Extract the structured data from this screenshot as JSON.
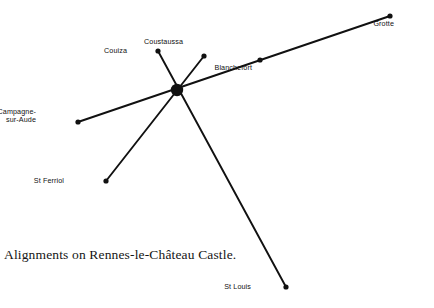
{
  "canvas": {
    "width": 434,
    "height": 308,
    "background": "#ffffff"
  },
  "caption": {
    "text": "Alignments on Rennes-le-Château Castle."
  },
  "style": {
    "line_color": "#111111",
    "node_color": "#111111",
    "line_width": 1.9,
    "node_radius": 2.6,
    "hub_radius": 6.2
  },
  "chart_data": {
    "type": "scatter",
    "title": "Alignments on Rennes-le-Château Castle.",
    "xlabel": "",
    "ylabel": "",
    "xlim": [
      0,
      434
    ],
    "ylim": [
      0,
      308
    ],
    "grid": false,
    "legend": "none",
    "hub": {
      "id": "castle",
      "label": "",
      "x": 177,
      "y": 90,
      "radius": 6.2
    },
    "points": [
      {
        "id": "grotte",
        "label": "Grotte",
        "x": 390,
        "y": 16,
        "label_x": 394,
        "label_y": 20,
        "label_align": "right",
        "lines": 1
      },
      {
        "id": "blanchefort",
        "label": "Blanchefort",
        "x": 260,
        "y": 60,
        "label_x": 252,
        "label_y": 64,
        "label_align": "right",
        "lines": 1
      },
      {
        "id": "coustaussa",
        "label": "Coustaussa",
        "x": 204,
        "y": 56,
        "label_x": 183,
        "label_y": 38,
        "label_align": "right",
        "lines": 1
      },
      {
        "id": "couiza",
        "label": "Couiza",
        "x": 158,
        "y": 51,
        "label_x": 127,
        "label_y": 47,
        "label_align": "right",
        "lines": 1
      },
      {
        "id": "campagne-sur-aude",
        "label": "Campagne-\nsur-Aude",
        "x": 78,
        "y": 122,
        "label_x": 36,
        "label_y": 108,
        "label_align": "right",
        "lines": 2
      },
      {
        "id": "st-ferriol",
        "label": "St Ferriol",
        "x": 106,
        "y": 181,
        "label_x": 64,
        "label_y": 177,
        "label_align": "right",
        "lines": 1
      },
      {
        "id": "st-louis",
        "label": "St Louis",
        "x": 286,
        "y": 287,
        "label_x": 251,
        "label_y": 283,
        "label_align": "right",
        "lines": 1
      }
    ],
    "alignments": [
      {
        "id": "campagne-grotte",
        "from": "campagne-sur-aude",
        "through": "castle",
        "to": "grotte",
        "x1": 78,
        "y1": 122,
        "x2": 390,
        "y2": 16
      },
      {
        "id": "couiza-stlouis",
        "from": "couiza",
        "through": "castle",
        "to": "st-louis",
        "x1": 158,
        "y1": 51,
        "x2": 286,
        "y2": 287
      },
      {
        "id": "coustaussa-stferriol",
        "from": "coustaussa",
        "through": "castle",
        "to": "st-ferriol",
        "x1": 204,
        "y1": 56,
        "x2": 106,
        "y2": 181
      }
    ]
  }
}
